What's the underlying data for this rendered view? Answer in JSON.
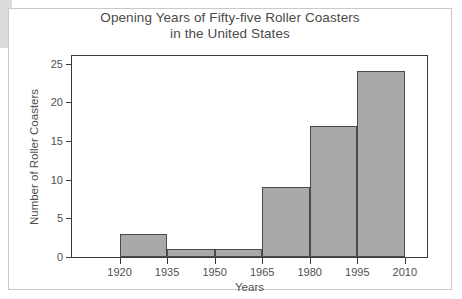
{
  "chart_data": {
    "type": "bar",
    "title": "Opening Years of Fifty-five Roller Coasters\nin the United States",
    "xlabel": "Years",
    "ylabel": "Number of Roller Coasters",
    "categories": [
      "1920-1935",
      "1935-1950",
      "1950-1965",
      "1965-1980",
      "1980-1995",
      "1995-2010"
    ],
    "bin_edges": [
      1920,
      1935,
      1950,
      1965,
      1980,
      1995,
      2010
    ],
    "values": [
      3,
      1,
      1,
      9,
      17,
      24
    ],
    "x_tick_labels": [
      "1920",
      "1935",
      "1950",
      "1965",
      "1980",
      "1995",
      "2010"
    ],
    "y_tick_labels": [
      "0",
      "5",
      "10",
      "15",
      "20",
      "25"
    ],
    "y_ticks": [
      0,
      5,
      10,
      15,
      20,
      25
    ],
    "ylim": [
      0,
      26
    ],
    "xlim": [
      1905,
      2017
    ],
    "grid": false,
    "legend": null,
    "bar_fill_color": "#a9a9a9",
    "bar_edge_color": "#4a4a4a",
    "axis_color": "#3a3a3a",
    "text_color": "#4f4f4f",
    "title_color": "#4a4a4a",
    "background_color": "#ffffff",
    "total": 55
  }
}
